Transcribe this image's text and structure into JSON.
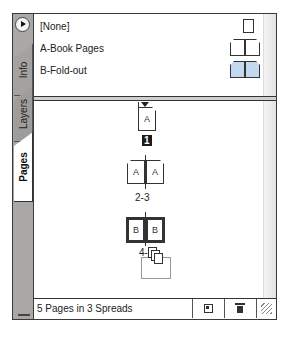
{
  "panel": {
    "menu_icon": "flyout-menu-icon",
    "tabs": [
      {
        "label": "Info",
        "active": false
      },
      {
        "label": "Layers",
        "active": false
      },
      {
        "label": "Pages",
        "active": true
      }
    ]
  },
  "masters": [
    {
      "name": "[None]",
      "icon": "single-page-icon"
    },
    {
      "name": "A-Book Pages",
      "icon": "spread-icon"
    },
    {
      "name": "B-Fold-out",
      "icon": "spread-highlighted-icon"
    }
  ],
  "pages": {
    "spreads": [
      {
        "pages": [
          {
            "master": "A"
          }
        ],
        "label": "1",
        "selected_label": true
      },
      {
        "pages": [
          {
            "master": "A"
          },
          {
            "master": "A"
          }
        ],
        "label": "2-3"
      },
      {
        "pages": [
          {
            "master": "B"
          },
          {
            "master": "B"
          }
        ],
        "label": "4-5",
        "selected_spread": true,
        "dragging": true
      }
    ]
  },
  "footer": {
    "status": "5 Pages in 3 Spreads",
    "buttons": [
      "new-page",
      "delete-page"
    ]
  },
  "colors": {
    "tab_column": "#a9a8a6",
    "fold_out_highlight": "#c3d9ef",
    "selected_label_bg": "#1b1b1b"
  }
}
